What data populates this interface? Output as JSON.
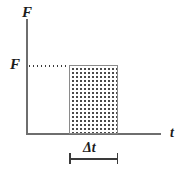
{
  "figure": {
    "labels": {
      "y_axis": "F",
      "y_value": "F",
      "x_axis": "t",
      "interval": "Δt"
    },
    "colors": {
      "axis": "#6e6e6e",
      "rect_border": "#8a8a8a",
      "dots": "#4a4a4a",
      "text": "#1c1c1c",
      "background": "#ffffff"
    }
  },
  "chart_data": {
    "type": "bar",
    "title": "",
    "xlabel": "t",
    "ylabel": "F",
    "grid": false,
    "legend": null,
    "xlim": [
      0,
      1
    ],
    "ylim": [
      0,
      1.45
    ],
    "categories": [
      "Δt"
    ],
    "values": [
      1.0
    ],
    "series": [
      {
        "name": "Constant force over interval",
        "x_start": 0.32,
        "x_end": 0.68,
        "height": 1.0,
        "fill": "dotted",
        "values": [
          1.0
        ]
      }
    ],
    "annotations": [
      {
        "text": "F",
        "kind": "y-axis-tick-label",
        "y": 1.0,
        "leader": "dotted horizontal line from y-axis to bar top"
      },
      {
        "text": "Δt",
        "kind": "dimension-label",
        "x_start": 0.32,
        "x_end": 0.68,
        "below_axis": true
      },
      {
        "text": "F",
        "kind": "axis-name",
        "position": "top-of-y-axis"
      },
      {
        "text": "t",
        "kind": "axis-name",
        "position": "right-of-x-axis"
      }
    ]
  }
}
